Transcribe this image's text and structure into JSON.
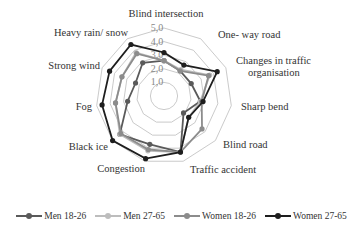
{
  "chart_data": {
    "type": "radar",
    "title": "",
    "categories": [
      "Blind intersection",
      "One- way road",
      "Changes in traffic organisation",
      "Sharp bend",
      "Blind road",
      "Traffic accident",
      "Congestion",
      "Black ice",
      "Fog",
      "Strong wind",
      "Heavy rain/ snow"
    ],
    "category_display": [
      [
        "Blind intersection"
      ],
      [
        "One- way road"
      ],
      [
        "Changes in traffic",
        "organisation"
      ],
      [
        "Sharp bend"
      ],
      [
        "Blind road"
      ],
      [
        "Traffic accident"
      ],
      [
        "Congestion"
      ],
      [
        "Black ice"
      ],
      [
        "Fog"
      ],
      [
        "Strong wind"
      ],
      [
        "Heavy rain/ snow"
      ]
    ],
    "rmin": 0,
    "rmax": 5,
    "ticks": [
      1.0,
      2.0,
      3.0,
      4.0,
      5.0
    ],
    "tick_labels": [
      "1,0",
      "2,0",
      "3,0",
      "4,0",
      "5,0"
    ],
    "grid": true,
    "legend_position": "bottom",
    "series": [
      {
        "name": "Men 18-26",
        "color": "#5a5a5a",
        "values": [
          2.6,
          2.2,
          2.2,
          2.7,
          1.9,
          4.3,
          3.7,
          4.3,
          2.7,
          2.3,
          2.9
        ]
      },
      {
        "name": "Men 27-65",
        "color": "#bdbdbd",
        "values": [
          2.6,
          2.3,
          3.7,
          2.7,
          2.4,
          4.3,
          4.2,
          4.3,
          3.6,
          3.4,
          3.8
        ]
      },
      {
        "name": "Women 18-26",
        "color": "#8c8c8c",
        "values": [
          2.6,
          2.2,
          3.6,
          2.8,
          3.7,
          4.3,
          4.1,
          4.2,
          3.6,
          3.4,
          3.7
        ]
      },
      {
        "name": "Women 27-65",
        "color": "#1e1e1e",
        "values": [
          3.2,
          2.7,
          4.3,
          2.9,
          2.4,
          4.3,
          4.8,
          5.0,
          4.6,
          4.4,
          4.5
        ]
      }
    ]
  },
  "legend": {
    "items": [
      {
        "label": "Men 18-26",
        "color": "#5a5a5a"
      },
      {
        "label": "Men 27-65",
        "color": "#bdbdbd"
      },
      {
        "label": "Women 18-26",
        "color": "#8c8c8c"
      },
      {
        "label": "Women 27-65",
        "color": "#1e1e1e"
      }
    ]
  }
}
